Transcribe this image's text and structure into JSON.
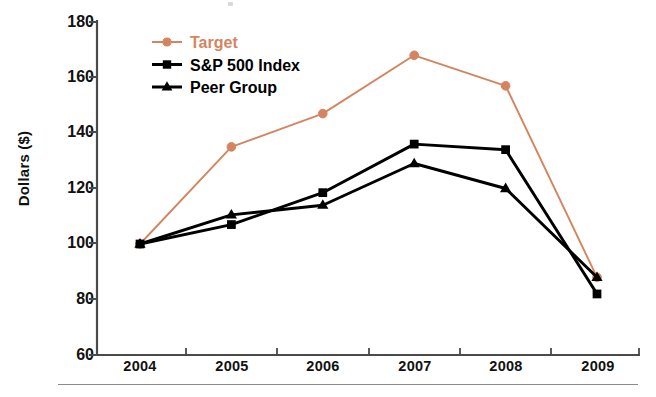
{
  "chart_data": {
    "type": "line",
    "title": "",
    "xlabel": "",
    "ylabel": "Dollars ($)",
    "categories": [
      "2004",
      "2005",
      "2006",
      "2007",
      "2008",
      "2009"
    ],
    "ylim": [
      60,
      180
    ],
    "yticks": [
      60,
      80,
      100,
      120,
      140,
      160,
      180
    ],
    "grid": false,
    "legend_position": "upper-left-inside",
    "series": [
      {
        "name": "Target",
        "color": "#D4855F",
        "marker": "circle",
        "values": [
          100,
          135,
          147,
          168,
          157,
          88
        ]
      },
      {
        "name": "S&P 500 Index",
        "color": "#000000",
        "marker": "square",
        "values": [
          100,
          107,
          118.5,
          136,
          134,
          82
        ]
      },
      {
        "name": "Peer Group",
        "color": "#000000",
        "marker": "triangle",
        "values": [
          100,
          110.5,
          114,
          129,
          120,
          88
        ]
      }
    ]
  },
  "axis": {
    "y_label": "Dollars ($)",
    "y_ticks": [
      "180",
      "160",
      "140",
      "120",
      "100",
      "80",
      "60"
    ],
    "x_ticks": [
      "2004",
      "2005",
      "2006",
      "2007",
      "2008",
      "2009"
    ]
  },
  "legend": {
    "items": [
      {
        "label": "Target",
        "color": "#D4855F",
        "marker": "circle-marker"
      },
      {
        "label": "S&P 500 Index",
        "color": "#000000",
        "marker": "square-marker"
      },
      {
        "label": "Peer Group",
        "color": "#000000",
        "marker": "triangle-marker"
      }
    ]
  }
}
